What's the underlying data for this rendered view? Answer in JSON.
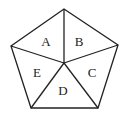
{
  "diagram": {
    "shape": "pentagon",
    "vertices": [
      [
        64,
        9
      ],
      [
        118,
        45
      ],
      [
        98,
        108
      ],
      [
        31,
        108
      ],
      [
        11,
        46
      ]
    ],
    "center": [
      64,
      63
    ],
    "regions": [
      {
        "label": "A",
        "x": 46,
        "y": 46
      },
      {
        "label": "B",
        "x": 79,
        "y": 46
      },
      {
        "label": "C",
        "x": 92,
        "y": 77
      },
      {
        "label": "D",
        "x": 63,
        "y": 95
      },
      {
        "label": "E",
        "x": 37,
        "y": 77
      }
    ],
    "stroke_color": "#222222"
  }
}
